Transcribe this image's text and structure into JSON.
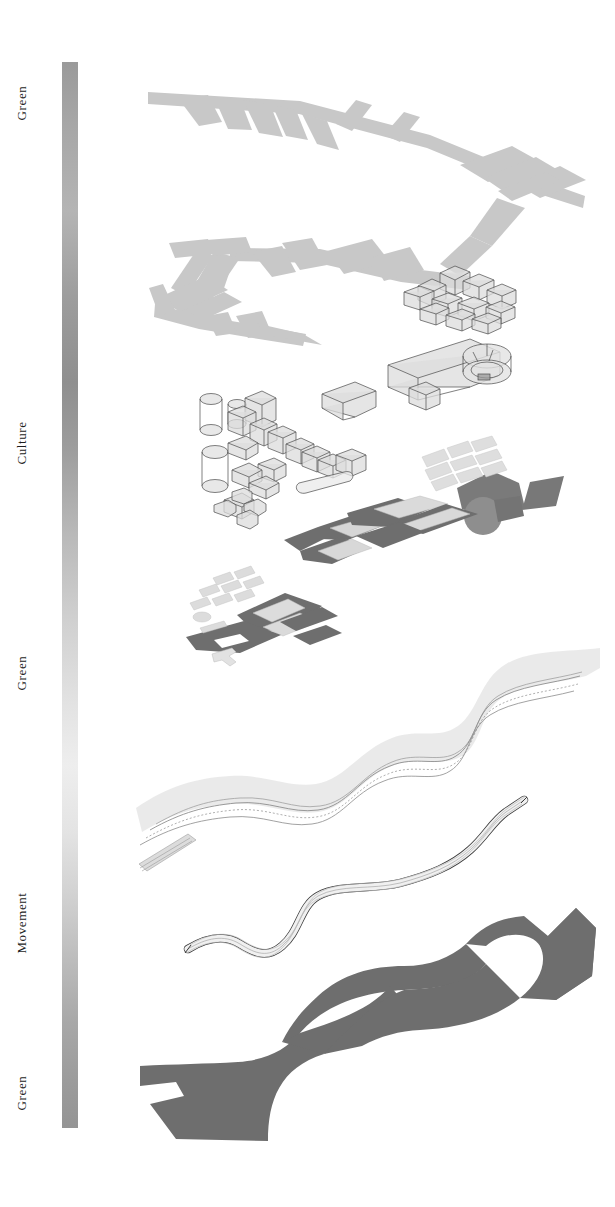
{
  "diagram": {
    "background_color": "#ffffff",
    "legend": {
      "orientation": "vertical",
      "gradient_from": "#9a9a9a",
      "gradient_to": "#949494",
      "labels": [
        {
          "text": "Green",
          "position_pct": 4
        },
        {
          "text": "Culture",
          "position_pct": 34
        },
        {
          "text": "Green",
          "position_pct": 55
        },
        {
          "text": "Movement",
          "position_pct": 78
        },
        {
          "text": "Green",
          "position_pct": 93
        }
      ]
    },
    "layers": [
      {
        "name": "green-network-top",
        "label": "Green",
        "description": "Branching green corridor / street network in axonometric plan",
        "fill": "#c8c8c8"
      },
      {
        "name": "culture-volumes",
        "label": "Culture",
        "description": "Wireframe axonometric building volumes, cylinders and ring structures",
        "fill": "#dcdcdc",
        "stroke": "#4a4a4a"
      },
      {
        "name": "culture-plazas",
        "label": "Culture",
        "description": "Dark angular plaza and landscape platforms with hatched surfaces",
        "fill": "#6e6e6e"
      },
      {
        "name": "green-river",
        "label": "Green",
        "description": "Meandering river corridor with contour lines",
        "fill": "#e3e3e3",
        "stroke": "#8d8d8d"
      },
      {
        "name": "movement-road",
        "label": "Movement",
        "description": "Multi-lane road ribbon",
        "fill": "#efefef",
        "stroke": "#3a3a3a"
      },
      {
        "name": "green-mass-bottom",
        "label": "Green",
        "description": "Large dark green open space mass with concave edges",
        "fill": "#6e6e6e"
      }
    ],
    "colors": {
      "light_gray": "#c8c8c8",
      "mid_gray": "#a8a8a8",
      "dark_gray": "#6e6e6e",
      "outline": "#3a3a3a",
      "text": "#1d1d1d"
    }
  }
}
